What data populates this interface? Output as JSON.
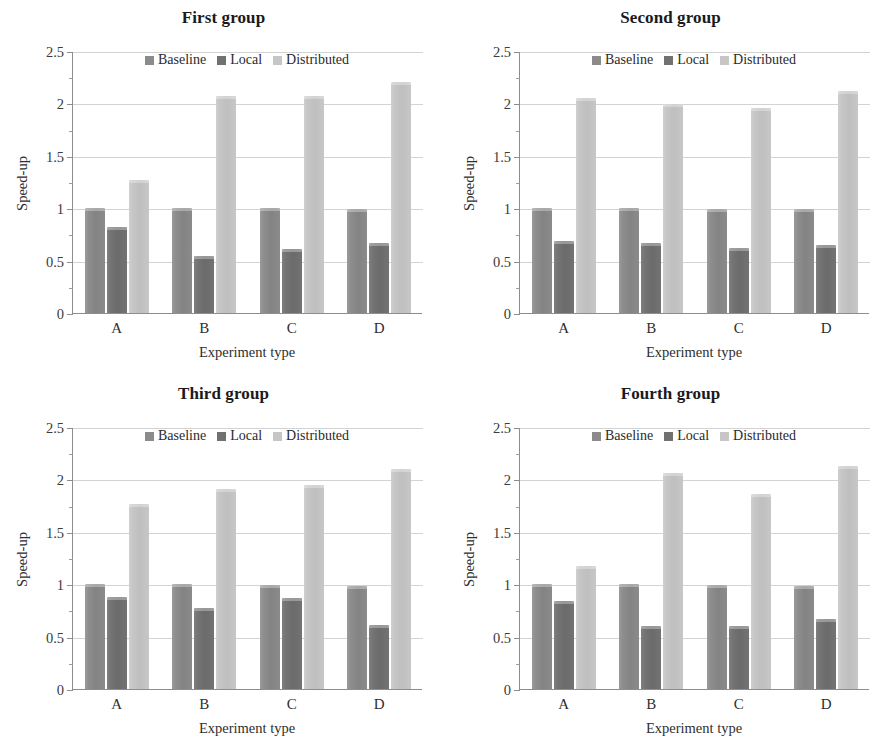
{
  "figure": {
    "width": 894,
    "height": 752,
    "background": "#ffffff",
    "panel_count": 4
  },
  "axis": {
    "ylabel": "Speed-up",
    "xlabel": "Experiment type",
    "ytick_labels": [
      "0",
      "0.5",
      "1",
      "1.5",
      "2",
      "2.5"
    ],
    "ytick_values": [
      0,
      0.5,
      1,
      1.5,
      2,
      2.5
    ],
    "yminor_values": [
      0.25,
      0.75,
      1.25,
      1.75,
      2.25
    ],
    "xtick_labels": [
      "A",
      "B",
      "C",
      "D"
    ],
    "ylim": [
      0,
      2.5
    ],
    "grid": true,
    "legend_position": "upper center"
  },
  "colors": {
    "baseline": "#8b8b8b",
    "local": "#717171",
    "distributed": "#c6c6c6",
    "gridline": "#d3d3d3",
    "axis": "#8d8d8d",
    "text": "#2b2b2b"
  },
  "legend": {
    "entries": [
      {
        "label": "Baseline",
        "color": "#8b8b8b",
        "swatch": "square-swatch"
      },
      {
        "label": "Local",
        "color": "#717171",
        "swatch": "square-swatch"
      },
      {
        "label": "Distributed",
        "color": "#c6c6c6",
        "swatch": "square-swatch"
      }
    ]
  },
  "chart_data": [
    {
      "type": "bar",
      "title": "First group",
      "xlabel": "Experiment type",
      "ylabel": "Speed-up",
      "categories": [
        "A",
        "B",
        "C",
        "D"
      ],
      "ylim": [
        0,
        2.5
      ],
      "yticks": [
        0,
        0.5,
        1,
        1.5,
        2,
        2.5
      ],
      "grid": true,
      "legend_position": "upper center",
      "series": [
        {
          "name": "Baseline",
          "values": [
            1.0,
            1.0,
            1.0,
            0.99
          ]
        },
        {
          "name": "Local",
          "values": [
            0.82,
            0.54,
            0.61,
            0.67
          ]
        },
        {
          "name": "Distributed",
          "values": [
            1.27,
            2.07,
            2.07,
            2.2
          ]
        }
      ]
    },
    {
      "type": "bar",
      "title": "Second group",
      "xlabel": "Experiment type",
      "ylabel": "Speed-up",
      "categories": [
        "A",
        "B",
        "C",
        "D"
      ],
      "ylim": [
        0,
        2.5
      ],
      "yticks": [
        0,
        0.5,
        1,
        1.5,
        2,
        2.5
      ],
      "grid": true,
      "legend_position": "upper center",
      "series": [
        {
          "name": "Baseline",
          "values": [
            1.0,
            1.0,
            0.99,
            0.99
          ]
        },
        {
          "name": "Local",
          "values": [
            0.69,
            0.67,
            0.62,
            0.65
          ]
        },
        {
          "name": "Distributed",
          "values": [
            2.05,
            1.99,
            1.96,
            2.12
          ]
        }
      ]
    },
    {
      "type": "bar",
      "title": "Third group",
      "xlabel": "Experiment type",
      "ylabel": "Speed-up",
      "categories": [
        "A",
        "B",
        "C",
        "D"
      ],
      "ylim": [
        0,
        2.5
      ],
      "yticks": [
        0,
        0.5,
        1,
        1.5,
        2,
        2.5
      ],
      "grid": true,
      "legend_position": "upper center",
      "series": [
        {
          "name": "Baseline",
          "values": [
            1.0,
            1.0,
            0.99,
            0.98
          ]
        },
        {
          "name": "Local",
          "values": [
            0.88,
            0.77,
            0.87,
            0.61
          ]
        },
        {
          "name": "Distributed",
          "values": [
            1.77,
            1.91,
            1.95,
            2.1
          ]
        }
      ]
    },
    {
      "type": "bar",
      "title": "Fourth group",
      "xlabel": "Experiment type",
      "ylabel": "Speed-up",
      "categories": [
        "A",
        "B",
        "C",
        "D"
      ],
      "ylim": [
        0,
        2.5
      ],
      "yticks": [
        0,
        0.5,
        1,
        1.5,
        2,
        2.5
      ],
      "grid": true,
      "legend_position": "upper center",
      "series": [
        {
          "name": "Baseline",
          "values": [
            1.0,
            1.0,
            0.99,
            0.98
          ]
        },
        {
          "name": "Local",
          "values": [
            0.84,
            0.6,
            0.6,
            0.67
          ]
        },
        {
          "name": "Distributed",
          "values": [
            1.17,
            2.06,
            1.86,
            2.13
          ]
        }
      ]
    }
  ]
}
